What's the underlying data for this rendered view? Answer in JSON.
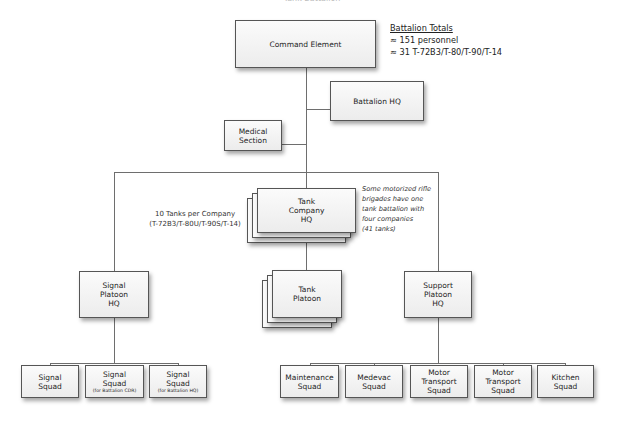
{
  "title_cut": "Tank Battalion",
  "totals": {
    "heading": "Battalion Totals",
    "personnel": "≈ 151 personnel",
    "tanks": "≈ 31 T-72B3/T-80/T-90/T-14"
  },
  "nodes": {
    "command_element": "Command Element",
    "battalion_hq": "Battalion HQ",
    "medical_section": [
      "Medical",
      "Section"
    ],
    "tank_company_hq": [
      "Tank",
      "Company",
      "HQ"
    ],
    "tank_platoon": [
      "Tank",
      "Platoon"
    ],
    "signal_platoon_hq": [
      "Signal",
      "Platoon",
      "HQ"
    ],
    "support_platoon_hq": [
      "Support",
      "Platoon",
      "HQ"
    ],
    "signal_squads": [
      {
        "lines": [
          "Signal",
          "Squad"
        ],
        "sub": ""
      },
      {
        "lines": [
          "Signal",
          "Squad"
        ],
        "sub": "(for Battalion CDR)"
      },
      {
        "lines": [
          "Signal",
          "Squad"
        ],
        "sub": "(for Battalion HQ)"
      }
    ],
    "support_squads": [
      {
        "lines": [
          "Maintenance",
          "Squad"
        ]
      },
      {
        "lines": [
          "Medevac",
          "Squad"
        ]
      },
      {
        "lines": [
          "Motor",
          "Transport",
          "Squad"
        ]
      },
      {
        "lines": [
          "Motor",
          "Transport",
          "Squad"
        ]
      },
      {
        "lines": [
          "Kitchen",
          "Squad"
        ]
      }
    ]
  },
  "notes": {
    "tanks_per_company": [
      "10 Tanks per Company",
      "(T-72B3/T-80U/T-90S/T-14)"
    ],
    "motorized_rifle": [
      "Some motorized rifle",
      "brigades have one",
      "tank battalion with",
      "four companies",
      "(41 tanks)"
    ]
  }
}
